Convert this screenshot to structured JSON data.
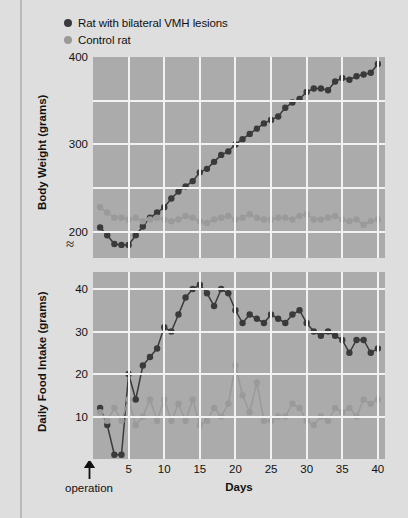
{
  "legend": {
    "items": [
      {
        "label": "Rat with bilateral VMH lesions",
        "color": "#3a3a3a",
        "marker": "filled-circle-dark"
      },
      {
        "label": "Control rat",
        "color": "#9a9a9a",
        "marker": "filled-circle-gray"
      }
    ]
  },
  "annotations": {
    "operation_label": "operation",
    "axis_break_symbol": "≈"
  },
  "chart_data": [
    {
      "type": "line",
      "id": "body-weight",
      "title": "",
      "xlabel": "Days",
      "ylabel": "Body Weight (grams)",
      "xlim": [
        0,
        41
      ],
      "ylim": [
        170,
        400
      ],
      "yticks": [
        200,
        300,
        400
      ],
      "ygridlines": [
        200,
        250,
        300,
        350,
        400
      ],
      "xticks": [
        5,
        10,
        15,
        20,
        25,
        30,
        35,
        40
      ],
      "xgridlines": [
        5,
        10,
        15,
        20,
        25,
        30,
        35,
        40
      ],
      "grid": true,
      "axis_break": true,
      "legend_position": "above-plot",
      "x": [
        1,
        2,
        3,
        4,
        5,
        6,
        7,
        8,
        9,
        10,
        11,
        12,
        13,
        14,
        15,
        16,
        17,
        18,
        19,
        20,
        21,
        22,
        23,
        24,
        25,
        26,
        27,
        28,
        29,
        30,
        31,
        32,
        33,
        34,
        35,
        36,
        37,
        38,
        39,
        40
      ],
      "series": [
        {
          "name": "Rat with bilateral VMH lesions",
          "color": "#3a3a3a",
          "values": [
            205,
            196,
            186,
            185,
            185,
            196,
            206,
            216,
            222,
            228,
            238,
            246,
            252,
            258,
            268,
            272,
            280,
            288,
            292,
            300,
            306,
            312,
            318,
            324,
            328,
            332,
            342,
            348,
            352,
            360,
            364,
            364,
            362,
            372,
            376,
            374,
            378,
            380,
            382,
            392
          ]
        },
        {
          "name": "Control rat",
          "color": "#9a9a9a",
          "values": [
            228,
            222,
            216,
            216,
            214,
            216,
            212,
            214,
            216,
            214,
            212,
            214,
            218,
            216,
            212,
            210,
            214,
            216,
            218,
            214,
            216,
            220,
            216,
            214,
            214,
            216,
            216,
            214,
            218,
            220,
            214,
            214,
            216,
            218,
            214,
            212,
            214,
            208,
            212,
            214
          ]
        }
      ]
    },
    {
      "type": "line",
      "id": "daily-food-intake",
      "title": "",
      "xlabel": "Days",
      "ylabel": "Daily Food Intake (grams)",
      "xlim": [
        0,
        41
      ],
      "ylim": [
        0,
        44
      ],
      "yticks": [
        10,
        20,
        30,
        40
      ],
      "ygridlines": [
        10,
        20,
        30,
        40
      ],
      "xticks": [
        5,
        10,
        15,
        20,
        25,
        30,
        35,
        40
      ],
      "xgridlines": [
        5,
        10,
        15,
        20,
        25,
        30,
        35,
        40
      ],
      "grid": true,
      "legend_position": "above-plot",
      "x": [
        1,
        2,
        3,
        4,
        5,
        6,
        7,
        8,
        9,
        10,
        11,
        12,
        13,
        14,
        15,
        16,
        17,
        18,
        19,
        20,
        21,
        22,
        23,
        24,
        25,
        26,
        27,
        28,
        29,
        30,
        31,
        32,
        33,
        34,
        35,
        36,
        37,
        38,
        39,
        40
      ],
      "series": [
        {
          "name": "Rat with bilateral VMH lesions",
          "color": "#3a3a3a",
          "values": [
            12,
            8,
            1,
            1,
            20,
            14,
            22,
            24,
            26,
            31,
            30,
            34,
            38,
            40,
            41,
            39,
            36,
            40,
            39,
            35,
            32,
            34,
            33,
            32,
            34,
            33,
            32,
            34,
            35,
            32,
            30,
            29,
            30,
            29,
            28,
            25,
            28,
            28,
            25,
            26
          ]
        },
        {
          "name": "Control rat",
          "color": "#9a9a9a",
          "values": [
            11,
            9,
            12,
            9,
            14,
            8,
            10,
            14,
            9,
            14,
            9,
            13,
            9,
            14,
            8,
            9,
            12,
            10,
            13,
            22,
            15,
            11,
            18,
            9,
            9,
            10,
            10,
            13,
            12,
            9,
            8,
            10,
            9,
            12,
            11,
            12,
            10,
            14,
            13,
            14
          ]
        }
      ]
    }
  ]
}
